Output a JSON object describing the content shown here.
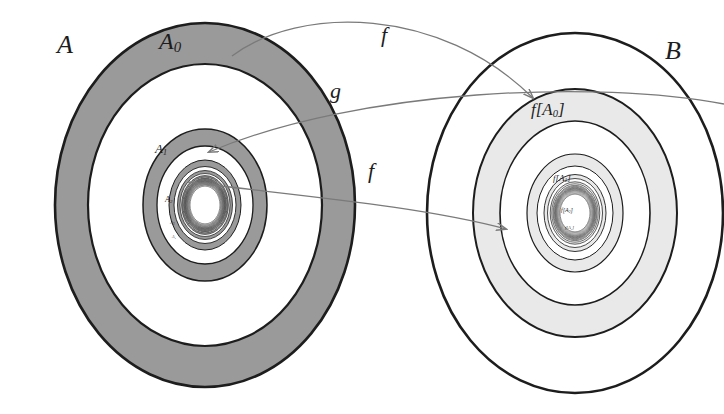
{
  "figure": {
    "background_color": "#ffffff",
    "stroke_color": "#1d1d1d",
    "arrow_color": "#7a7a7a",
    "shade_left": "#9a9a9a",
    "shade_right": "#e9e9e9",
    "fill_white": "#ffffff"
  },
  "labels": {
    "set_a": "A",
    "set_b": "B",
    "a0": "A",
    "a0_sub": "0",
    "a1": "A",
    "a1_sub": "1",
    "a2": "A",
    "a2_sub": "2",
    "a3": "A",
    "a3_sub": "3",
    "a4": "A",
    "a4_sub": "4",
    "fa0_open": "f[A",
    "fa0_sub": "0",
    "fa0_close": "]",
    "fa1_open": "f[A",
    "fa1_sub": "1",
    "fa1_close": "]",
    "fa2_open": "f[A",
    "fa2_sub": "2",
    "fa2_close": "]",
    "fa3_open": "f[A",
    "fa3_sub": "3",
    "fa3_close": "]",
    "arrow_f_top": "f",
    "arrow_g_mid": "g",
    "arrow_f_bottom": "f"
  },
  "arrows": [
    {
      "name": "f-top",
      "label": "f",
      "from": "A0 boundary",
      "to": "f[A0] region",
      "direction": "left-to-right"
    },
    {
      "name": "g-middle",
      "label": "g",
      "from": "B outer",
      "to": "A1 region",
      "direction": "right-to-left"
    },
    {
      "name": "f-bottom",
      "label": "f",
      "from": "A1 boundary",
      "to": "f[A1] region",
      "direction": "left-to-right"
    }
  ],
  "ellipses": {
    "left_center_x": 205,
    "left_center_y": 205,
    "right_center_x": 575,
    "right_center_y": 213,
    "left_rings": [
      {
        "rx": 150,
        "ry": 182,
        "fill": "#9a9a9a",
        "stroke_width": 2.6
      },
      {
        "rx": 117,
        "ry": 141,
        "fill": "#ffffff",
        "stroke_width": 2.2
      },
      {
        "rx": 62,
        "ry": 76,
        "fill": "#9a9a9a",
        "stroke_width": 1.5
      },
      {
        "rx": 48,
        "ry": 59,
        "fill": "#ffffff",
        "stroke_width": 1.3
      },
      {
        "rx": 36,
        "ry": 45,
        "fill": "#9a9a9a",
        "stroke_width": 1.0
      },
      {
        "rx": 31,
        "ry": 38,
        "fill": "#ffffff",
        "stroke_width": 0.9
      },
      {
        "rx": 27,
        "ry": 34,
        "fill": "#9a9a9a",
        "stroke_width": 0.8
      },
      {
        "rx": 25,
        "ry": 31,
        "fill": "#ffffff",
        "stroke_width": 0.7
      },
      {
        "rx": 23,
        "ry": 29,
        "fill": "#9a9a9a",
        "stroke_width": 0.6
      },
      {
        "rx": 22,
        "ry": 27.5,
        "fill": "#ffffff",
        "stroke_width": 0.6
      },
      {
        "rx": 21,
        "ry": 26.5,
        "fill": "#9a9a9a",
        "stroke_width": 0.5
      },
      {
        "rx": 20.3,
        "ry": 25.6,
        "fill": "#ffffff",
        "stroke_width": 0.5
      }
    ],
    "right_rings": [
      {
        "rx": 148,
        "ry": 180,
        "fill": "#ffffff",
        "stroke_width": 2.6
      },
      {
        "rx": 102,
        "ry": 124,
        "fill": "#e9e9e9",
        "stroke_width": 2.0
      },
      {
        "rx": 75,
        "ry": 92,
        "fill": "#ffffff",
        "stroke_width": 1.6
      },
      {
        "rx": 48,
        "ry": 59,
        "fill": "#e9e9e9",
        "stroke_width": 1.2
      },
      {
        "rx": 38,
        "ry": 47,
        "fill": "#ffffff",
        "stroke_width": 1.0
      },
      {
        "rx": 31,
        "ry": 38,
        "fill": "#e9e9e9",
        "stroke_width": 0.9
      },
      {
        "rx": 27,
        "ry": 34,
        "fill": "#ffffff",
        "stroke_width": 0.8
      },
      {
        "rx": 24.5,
        "ry": 31,
        "fill": "#e9e9e9",
        "stroke_width": 0.7
      },
      {
        "rx": 23,
        "ry": 29,
        "fill": "#ffffff",
        "stroke_width": 0.6
      },
      {
        "rx": 22,
        "ry": 27.5,
        "fill": "#e9e9e9",
        "stroke_width": 0.6
      },
      {
        "rx": 21.2,
        "ry": 26.6,
        "fill": "#ffffff",
        "stroke_width": 0.5
      }
    ]
  }
}
